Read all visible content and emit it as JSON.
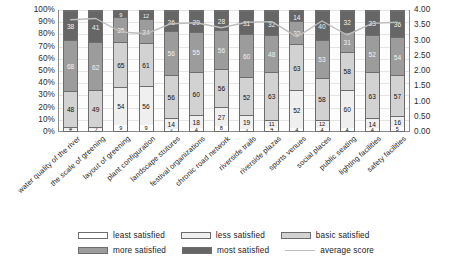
{
  "chart_data": {
    "type": "bar",
    "title": "",
    "subtitle": "",
    "xlabel": "",
    "ylabel": "",
    "y2label": "",
    "grid": true,
    "stacked": true,
    "stack_mode": "percent",
    "legend_position": "bottom",
    "ylim": [
      0,
      100
    ],
    "y2lim": [
      0,
      4
    ],
    "ytick_labels": [
      "100%",
      "90%",
      "80%",
      "70%",
      "60%",
      "50%",
      "40%",
      "30%",
      "20%",
      "10%",
      "0%"
    ],
    "ytick_values": [
      100,
      90,
      80,
      70,
      60,
      50,
      40,
      30,
      20,
      10,
      0
    ],
    "y2tick_labels": [
      "4.00",
      "3.50",
      "3.00",
      "2.50",
      "2.00",
      "1.50",
      "1.00",
      "0.50",
      "0.00"
    ],
    "y2tick_values": [
      4.0,
      3.5,
      3.0,
      2.5,
      2.0,
      1.5,
      1.0,
      0.5,
      0.0
    ],
    "categories": [
      "water quality of the river",
      "the scale of greening",
      "layout of greening",
      "plant configuration",
      "landscape stutures",
      "festival organizations",
      "chronic road network",
      "riverside trails",
      "riverside plazas",
      "sports venues",
      "social places",
      "public seating",
      "lighting facilities",
      "safety facilities"
    ],
    "series": [
      {
        "name": "least satisfied",
        "color": "#ffffff",
        "values": [
          2,
          2,
          9,
          9,
          3,
          4,
          8,
          3,
          4,
          4,
          4,
          4,
          4,
          5
        ]
      },
      {
        "name": "less satisfied",
        "color": "#efefef",
        "values": [
          4,
          3,
          54,
          56,
          14,
          18,
          27,
          19,
          11,
          52,
          12,
          60,
          14,
          16
        ]
      },
      {
        "name": "basic satisfied",
        "color": "#d2d2d2",
        "values": [
          48,
          49,
          65,
          61,
          56,
          60,
          56,
          52,
          63,
          63,
          58,
          58,
          63,
          57
        ]
      },
      {
        "name": "more satisfied",
        "color": "#9c9c9c",
        "values": [
          68,
          62,
          35,
          34,
          56,
          55,
          56,
          60,
          48,
          32,
          53,
          31,
          52,
          54
        ]
      },
      {
        "name": "most satisfied",
        "color": "#666666",
        "values": [
          38,
          41,
          9,
          12,
          26,
          29,
          28,
          31,
          32,
          14,
          40,
          32,
          33,
          36
        ]
      }
    ],
    "average_score": {
      "name": "average score",
      "color": "#bdbdbd",
      "values": [
        3.68,
        3.72,
        3.28,
        3.22,
        3.55,
        3.58,
        3.42,
        3.6,
        3.62,
        3.12,
        3.64,
        3.18,
        3.56,
        3.6
      ]
    }
  },
  "legend": {
    "items": [
      {
        "label": "least satisfied",
        "type": "swatch",
        "color": "#ffffff"
      },
      {
        "label": "less satisfied",
        "type": "swatch",
        "color": "#efefef"
      },
      {
        "label": "basic satisfied",
        "type": "swatch",
        "color": "#d2d2d2"
      },
      {
        "label": "more satisfied",
        "type": "swatch",
        "color": "#9c9c9c"
      },
      {
        "label": "most satisfied",
        "type": "swatch",
        "color": "#666666"
      },
      {
        "label": "average score",
        "type": "line",
        "color": "#bdbdbd"
      }
    ]
  }
}
